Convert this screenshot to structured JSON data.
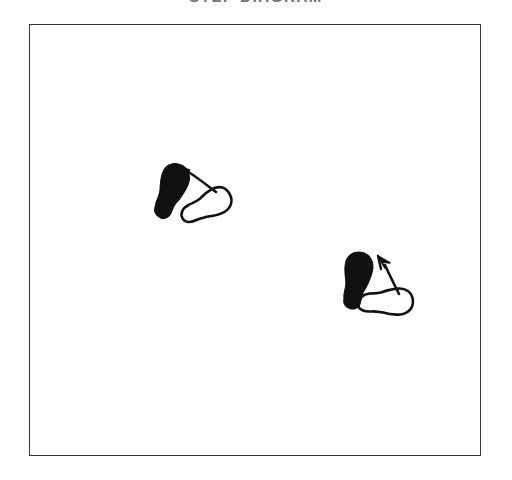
{
  "figure": {
    "title": "STEP DIAGRAM",
    "title_color": "#6f6f74",
    "background_color": "#fdfdfd",
    "frame": {
      "border_color": "#36363a",
      "fill_color": "#fefefe",
      "x": 29,
      "y": 24,
      "width": 452,
      "height": 432
    },
    "ink_color": "#111111",
    "step_pairs": [
      {
        "name": "step-pair-1",
        "filled_footprint": {
          "label": "filled-sole",
          "center_x": 171,
          "center_y": 192,
          "rotation_deg": 18,
          "length": 58,
          "width": 26
        },
        "outlined_footprint": {
          "label": "outlined-sole",
          "center_x": 206,
          "center_y": 207,
          "rotation_deg": 62,
          "length": 54,
          "width": 24
        },
        "arrow": {
          "label": "motion-arrow",
          "direction": "up-left",
          "tip_x": 179,
          "tip_y": 167,
          "tail_x": 216,
          "tail_y": 192
        }
      },
      {
        "name": "step-pair-2",
        "filled_footprint": {
          "label": "filled-sole",
          "center_x": 357,
          "center_y": 281,
          "rotation_deg": 8,
          "length": 58,
          "width": 25
        },
        "outlined_footprint": {
          "label": "outlined-sole",
          "center_x": 385,
          "center_y": 303,
          "rotation_deg": 84,
          "length": 56,
          "width": 24
        },
        "arrow": {
          "label": "motion-arrow",
          "direction": "up-right",
          "tip_x": 381,
          "tip_y": 257,
          "tail_x": 398,
          "tail_y": 293
        }
      }
    ]
  }
}
